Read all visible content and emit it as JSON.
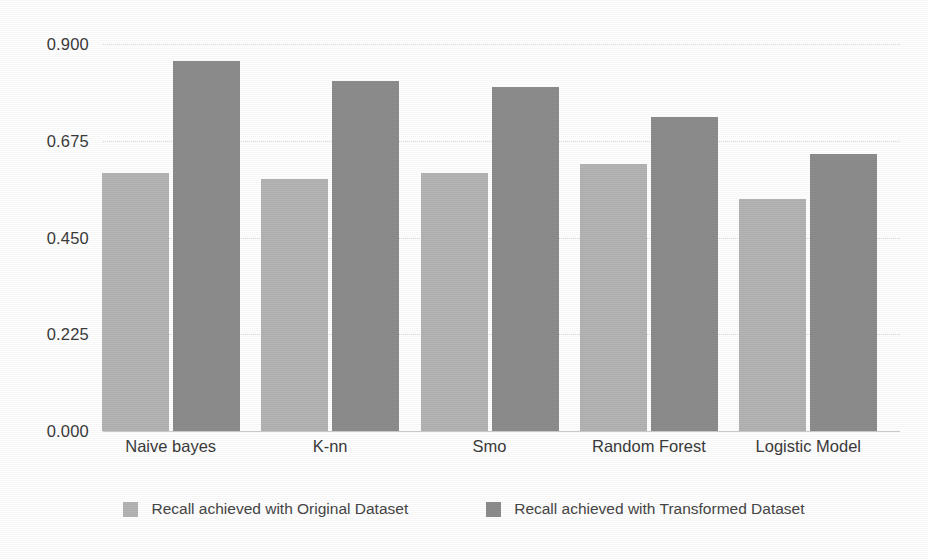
{
  "chart_data": {
    "type": "bar",
    "title": "",
    "subtitle": "",
    "xlabel": "",
    "ylabel": "",
    "categories": [
      "Naive bayes",
      "K-nn",
      "Smo",
      "Random Forest",
      "Logistic Model"
    ],
    "series": [
      {
        "name": "Recall achieved with Original Dataset",
        "color": "#b3b3b3",
        "values": [
          0.6,
          0.585,
          0.6,
          0.62,
          0.54
        ]
      },
      {
        "name": "Recall achieved with Transformed Dataset",
        "color": "#8c8c8c",
        "values": [
          0.86,
          0.815,
          0.8,
          0.73,
          0.645
        ]
      }
    ],
    "ylim": [
      0.0,
      0.9
    ],
    "ytick_labels": [
      "0.900",
      "0.675",
      "0.450",
      "0.225",
      "0.000"
    ],
    "ytick_values": [
      0.9,
      0.675,
      0.45,
      0.225,
      0.0
    ],
    "grid": true,
    "grid_axis": "y",
    "grid_style": "dotted",
    "legend_position": "bottom-center",
    "annotations": []
  },
  "axis": {
    "y_ticks": [
      {
        "label": "0.900",
        "value": 0.9
      },
      {
        "label": "0.675",
        "value": 0.675
      },
      {
        "label": "0.450",
        "value": 0.45
      },
      {
        "label": "0.225",
        "value": 0.225
      },
      {
        "label": "0.000",
        "value": 0.0
      }
    ],
    "x_categories": [
      "Naive bayes",
      "K-nn",
      "Smo",
      "Random Forest",
      "Logistic Model"
    ]
  },
  "legend": {
    "items": [
      {
        "label": "Recall achieved with Original Dataset",
        "swatch": "original",
        "color": "#b3b3b3"
      },
      {
        "label": "Recall achieved with Transformed Dataset",
        "swatch": "transformed",
        "color": "#8c8c8c"
      }
    ]
  },
  "colors": {
    "background": "#fefefe",
    "original_bar": "#b3b3b3",
    "transformed_bar": "#8c8c8c",
    "gridline": "#d8d8d8",
    "axis_line": "#c9c9c9",
    "text": "#3a3a3a"
  }
}
